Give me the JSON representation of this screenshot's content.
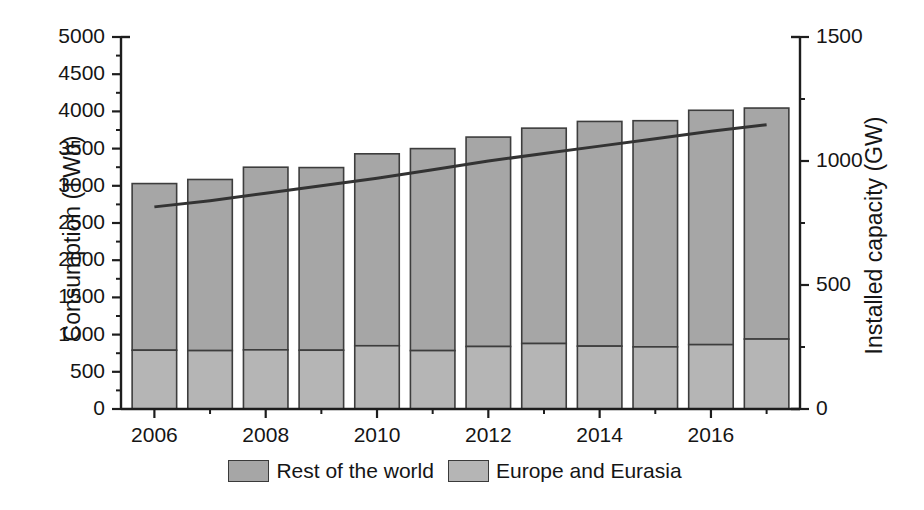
{
  "chart_data": {
    "type": "bar",
    "title": "",
    "subtitle": "",
    "xlabel": "",
    "ylabel": "Consumption (TWh)",
    "y2label": "Installed capacity (GW)",
    "grid": false,
    "legend_position": "bottom-center",
    "categories": [
      2006,
      2007,
      2008,
      2009,
      2010,
      2011,
      2012,
      2013,
      2014,
      2015,
      2016,
      2017
    ],
    "xtick_labels": [
      "2006",
      "2008",
      "2010",
      "2012",
      "2014",
      "2016"
    ],
    "xtick_values": [
      2006,
      2008,
      2010,
      2012,
      2014,
      2016
    ],
    "xlim": [
      2005.4,
      2017.6
    ],
    "ylim": [
      0,
      5000
    ],
    "ytick_labels": [
      "0",
      "500",
      "1000",
      "1500",
      "2000",
      "2500",
      "3000",
      "3500",
      "4000",
      "4500",
      "5000"
    ],
    "ytick_values": [
      0,
      500,
      1000,
      1500,
      2000,
      2500,
      3000,
      3500,
      4000,
      4500,
      5000
    ],
    "y2lim": [
      0,
      1500
    ],
    "y2tick_labels": [
      "0",
      "500",
      "1000",
      "1500"
    ],
    "y2tick_values": [
      0,
      500,
      1000,
      1500
    ],
    "y2_minor_tick_values": [
      250,
      750,
      1250
    ],
    "stacked": true,
    "series": [
      {
        "name": "Europe and Eurasia",
        "color": "#b5b5b5",
        "axis": "left",
        "values": [
          790,
          785,
          795,
          790,
          850,
          785,
          840,
          880,
          845,
          835,
          865,
          940
        ]
      },
      {
        "name": "Rest of the world",
        "color": "#a6a6a6",
        "axis": "left",
        "values": [
          2240,
          2300,
          2455,
          2455,
          2580,
          2715,
          2815,
          2895,
          3020,
          3040,
          3150,
          3105
        ]
      }
    ],
    "totals": [
      3030,
      3085,
      3250,
      3245,
      3430,
      3500,
      3655,
      3775,
      3865,
      3875,
      4015,
      4045
    ],
    "line_series": {
      "name": "Installed capacity",
      "axis": "right",
      "color": "#333333",
      "x": [
        2006,
        2007,
        2008,
        2009,
        2010,
        2011,
        2012,
        2013,
        2014,
        2015,
        2016,
        2017
      ],
      "values": [
        815,
        840,
        870,
        900,
        930,
        965,
        1000,
        1030,
        1060,
        1090,
        1120,
        1146
      ]
    }
  },
  "axes": {
    "left_title": "Consumption (TWh)",
    "right_title": "Installed capacity (GW)"
  },
  "legend": {
    "items": [
      {
        "label": "Rest of the world",
        "color": "#a6a6a6"
      },
      {
        "label": "Europe and Eurasia",
        "color": "#b5b5b5"
      }
    ]
  }
}
